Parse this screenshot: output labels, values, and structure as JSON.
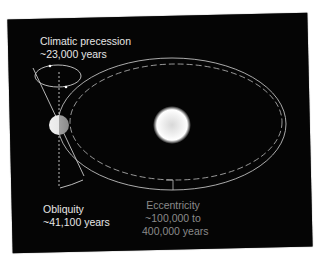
{
  "diagram": {
    "background_color": "#050505",
    "labels": {
      "precession": {
        "line1": "Climatic precession",
        "line2": "~23,000 years"
      },
      "obliquity": {
        "line1": "Obliquity",
        "line2": "~41,100 years"
      },
      "eccentricity": {
        "line1": "Eccentricity",
        "line2": "~100,000 to",
        "line3": "400,000 years"
      }
    },
    "bodies": [
      {
        "name": "Sun",
        "cx": 172,
        "cy": 125,
        "r": 17
      },
      {
        "name": "Earth",
        "cx": 59,
        "cy": 125,
        "r": 10
      }
    ],
    "orbits": [
      {
        "style": "solid",
        "cx": 172,
        "cy": 124,
        "rx": 114,
        "ry": 66
      },
      {
        "style": "dashed",
        "cx": 176,
        "cy": 122,
        "rx": 106,
        "ry": 58
      }
    ],
    "colors": {
      "label_primary": "#e6e6e6",
      "label_eccentricity": "#8a8a8a",
      "lines": "#bdbdbd"
    }
  }
}
